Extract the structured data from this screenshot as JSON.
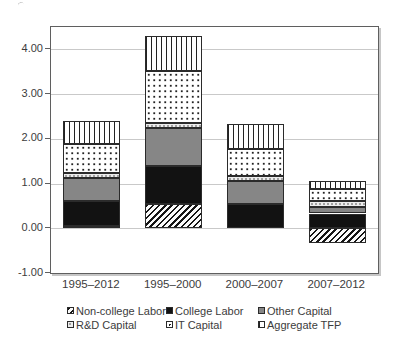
{
  "chart_data": {
    "type": "bar",
    "stacked": true,
    "title": "",
    "xlabel": "",
    "ylabel": "",
    "categories": [
      "1995–2012",
      "1995–2000",
      "2000–2007",
      "2007–2012"
    ],
    "series": [
      {
        "name": "Non-college Labor",
        "pattern": "diagonal-hatch",
        "values": [
          0.05,
          0.55,
          0.0,
          -0.33
        ]
      },
      {
        "name": "College Labor",
        "pattern": "solid-black",
        "values": [
          0.55,
          0.85,
          0.55,
          0.33
        ]
      },
      {
        "name": "Other Capital",
        "pattern": "solid-gray",
        "values": [
          0.52,
          0.85,
          0.51,
          0.15
        ]
      },
      {
        "name": "R&D Capital",
        "pattern": "light-dots",
        "values": [
          0.12,
          0.11,
          0.11,
          0.14
        ]
      },
      {
        "name": "IT Capital",
        "pattern": "dots",
        "values": [
          0.65,
          1.15,
          0.6,
          0.25
        ]
      },
      {
        "name": "Aggregate TFP",
        "pattern": "vertical-lines",
        "values": [
          0.51,
          0.8,
          0.56,
          0.18
        ]
      }
    ],
    "bar_totals": [
      2.4,
      4.31,
      2.33,
      1.05
    ],
    "ylim": [
      -1.0,
      4.5
    ],
    "gridline_values": [
      4,
      3,
      2,
      1,
      0
    ],
    "grid": true,
    "legend_position": "bottom"
  },
  "y_axis": {
    "ticks": [
      {
        "value": 4,
        "label": "4.00"
      },
      {
        "value": 3,
        "label": "3.00"
      },
      {
        "value": 2,
        "label": "2.00"
      },
      {
        "value": 1,
        "label": "1.00"
      },
      {
        "value": 0,
        "label": "0.00"
      },
      {
        "value": -1,
        "label": "-1.00"
      }
    ]
  },
  "legend": {
    "items": [
      {
        "name": "Non-college Labor",
        "pattern": "diagonal-hatch"
      },
      {
        "name": "College Labor",
        "pattern": "solid-black"
      },
      {
        "name": "Other Capital",
        "pattern": "solid-gray"
      },
      {
        "name": "R&D Capital",
        "pattern": "light-dots"
      },
      {
        "name": "IT Capital",
        "pattern": "dots"
      },
      {
        "name": "Aggregate TFP",
        "pattern": "vertical-lines"
      }
    ]
  },
  "colors": {
    "background": "#ffffff",
    "plot_border": "#5f5f5f",
    "plot_shadow": "#c6c6c6",
    "gridline": "#c9c9c9",
    "segment_border": "#2b2b2b",
    "solid_black": "#121212",
    "solid_gray": "#868686",
    "light_dot_fill": "#ececec",
    "text": "#3c3c3c"
  }
}
